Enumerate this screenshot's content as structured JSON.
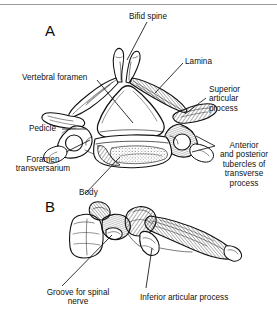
{
  "figure": {
    "background_color": "#ffffff",
    "ink_color": "#101010",
    "rule_color": "#9a9a9a"
  },
  "panels": [
    {
      "id": "A",
      "name": "superior-view",
      "letter": "A"
    },
    {
      "id": "B",
      "name": "lateral-view",
      "letter": "B"
    }
  ],
  "labels": {
    "bifid_spine": "Bifid spine",
    "lamina": "Lamina",
    "vertebral_foramen": "Vertebral foramen",
    "superior_articular_process": "Superior\narticular\nprocess",
    "pedicle": "Pedicle",
    "foramen_transversarium": "Foramen\ntransversarium",
    "anterior_posterior_tubercles": "Anterior\nand posterior\ntubercles of\ntransverse\nprocess",
    "body": "Body",
    "groove_for_spinal_nerve": "Groove for spinal\nnerve",
    "inferior_articular_process": "Inferior articular process"
  }
}
